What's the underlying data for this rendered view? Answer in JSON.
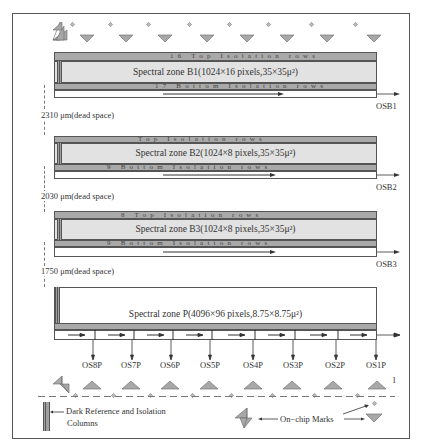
{
  "diagram": {
    "zones": [
      {
        "id": "B1",
        "top_iso": "16 Top Isolation rows",
        "body": "Spectral zone B1(1024×16 pixels,35×35μ²)",
        "bottom_iso": "17 Bottom Isolation rows",
        "output": "OSB1"
      },
      {
        "id": "B2",
        "top_iso": "Top Isolation rows",
        "body": "Spectral zone B2(1024×8 pixels,35×35μ²)",
        "bottom_iso": "9 Bottom Isolation rows",
        "output": "OSB2"
      },
      {
        "id": "B3",
        "top_iso": "8 Top Isolation rows",
        "body": "Spectral zone B3(1024×8 pixels,35×35μ²)",
        "bottom_iso": "9 Bottom Isolation rows",
        "output": "OSB3"
      },
      {
        "id": "P",
        "body": "Spectral zone P(4096×96 pixels,8.75×8.75μ²)"
      }
    ],
    "dead_spaces": [
      "2310 μm(dead space)",
      "2030 μm(dead space)",
      "1750 μm(dead space)"
    ],
    "p_outputs": [
      "OS8P",
      "OS7P",
      "OS6P",
      "OS5P",
      "OS4P",
      "OS3P",
      "OS2P",
      "OS1P"
    ],
    "pin_one_label": "1",
    "legend": {
      "dark_ref": "Dark Reference and Isolation",
      "dark_ref_line2": "Columns",
      "marks": "On−chip Marks"
    },
    "colors": {
      "isolation": "#a9a9a9",
      "zone_fill": "#e2e2e2",
      "mark": "#a8a8a8",
      "line": "#555555"
    }
  }
}
